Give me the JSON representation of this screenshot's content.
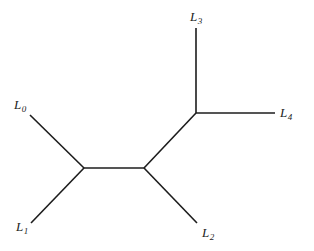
{
  "diagram": {
    "type": "unrooted-phylogenetic-tree",
    "background_color": "#ffffff",
    "line_color": "#1c1c1c",
    "line_width": 1.6,
    "canvas": {
      "width": 314,
      "height": 251
    },
    "leaves": [
      {
        "id": "L0",
        "letter": "L",
        "subscript": "0",
        "label_x": 14,
        "label_y": 98,
        "tip_x": 30,
        "tip_y": 115
      },
      {
        "id": "L1",
        "letter": "L",
        "subscript": "1",
        "label_x": 16,
        "label_y": 220,
        "tip_x": 31,
        "tip_y": 223
      },
      {
        "id": "L2",
        "letter": "L",
        "subscript": "2",
        "label_x": 202,
        "label_y": 226,
        "tip_x": 197,
        "tip_y": 223
      },
      {
        "id": "L3",
        "letter": "L",
        "subscript": "3",
        "label_x": 190,
        "label_y": 10,
        "tip_x": 196,
        "tip_y": 28
      },
      {
        "id": "L4",
        "letter": "L",
        "subscript": "4",
        "label_x": 280,
        "label_y": 106,
        "tip_x": 275,
        "tip_y": 113
      }
    ],
    "nodes": [
      {
        "id": "node-left",
        "x": 84,
        "y": 168
      },
      {
        "id": "node-middle",
        "x": 144,
        "y": 168
      },
      {
        "id": "node-right",
        "x": 196,
        "y": 113
      }
    ],
    "edges": [
      {
        "id": "edge-L0",
        "from": "L0",
        "to": "node-left",
        "x1": 30,
        "y1": 115,
        "x2": 84,
        "y2": 168
      },
      {
        "id": "edge-L1",
        "from": "L1",
        "to": "node-left",
        "x1": 31,
        "y1": 223,
        "x2": 84,
        "y2": 168
      },
      {
        "id": "edge-internal-left",
        "from": "node-left",
        "to": "node-middle",
        "x1": 84,
        "y1": 168,
        "x2": 144,
        "y2": 168
      },
      {
        "id": "edge-L2",
        "from": "node-middle",
        "to": "L2",
        "x1": 144,
        "y1": 168,
        "x2": 197,
        "y2": 223
      },
      {
        "id": "edge-internal-right",
        "from": "node-middle",
        "to": "node-right",
        "x1": 144,
        "y1": 168,
        "x2": 196,
        "y2": 113
      },
      {
        "id": "edge-L3",
        "from": "node-right",
        "to": "L3",
        "x1": 196,
        "y1": 113,
        "x2": 196,
        "y2": 28
      },
      {
        "id": "edge-L4",
        "from": "node-right",
        "to": "L4",
        "x1": 196,
        "y1": 113,
        "x2": 275,
        "y2": 113
      }
    ]
  }
}
